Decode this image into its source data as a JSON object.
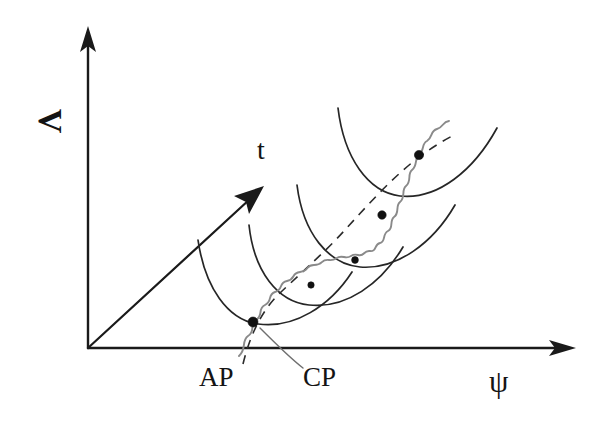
{
  "figure": {
    "kind": "potential-energy-surface-diagram",
    "background_color": "#ffffff",
    "axes": {
      "y_axis_label": "V",
      "x_axis_label": "ψ",
      "origin": [
        88,
        348
      ],
      "y_axis_top": [
        88,
        30
      ],
      "x_axis_right": [
        575,
        348
      ],
      "line_color": "#1a1a1a"
    },
    "time_arrow": {
      "label": "t",
      "from": [
        88,
        348
      ],
      "to": [
        262,
        187
      ],
      "color": "#1a1a1a"
    },
    "annotations": [
      {
        "name": "adiabatic-point",
        "label": "AP",
        "text_position": [
          199,
          364
        ],
        "marker_position": [
          253,
          322
        ]
      },
      {
        "name": "crossing-point",
        "label": "CP",
        "text_position": [
          303,
          364
        ],
        "leader_from": [
          300,
          360
        ],
        "leader_to": [
          258,
          326
        ]
      }
    ],
    "potential_arcs": {
      "count": 4,
      "color": "#262626",
      "description": "nested parabolic potential wells displaced along the time arrow"
    },
    "trajectory": {
      "wave_color": "#8a8a8a",
      "guide_color": "#2b2b2b",
      "guide_style": "dashed",
      "marker_color": "#111111",
      "marker_count": 5,
      "markers": [
        [
          253,
          322
        ],
        [
          311,
          285
        ],
        [
          355,
          260
        ],
        [
          382,
          215
        ],
        [
          419,
          155
        ]
      ]
    }
  }
}
